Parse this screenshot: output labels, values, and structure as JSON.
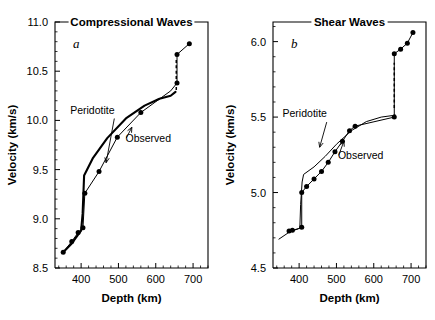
{
  "figure": {
    "background": "#ffffff",
    "ink_color": "#000000",
    "panels": [
      "a",
      "b"
    ]
  },
  "chart_data": [
    {
      "type": "line",
      "panel_letter": "a",
      "title": "Compressional Waves",
      "xlabel": "Depth (km)",
      "ylabel": "Velocity (km/s)",
      "xlim": [
        330,
        740
      ],
      "ylim": [
        8.5,
        11.0
      ],
      "xticks": [
        400,
        500,
        600,
        700
      ],
      "xtick_labels": [
        "400",
        "500",
        "600",
        "700"
      ],
      "x_minor_step": 20,
      "yticks": [
        8.5,
        9.0,
        9.5,
        10.0,
        10.5,
        11.0
      ],
      "ytick_labels": [
        "8.5",
        "9.0",
        "9.5",
        "10.0",
        "10.5",
        "11.0"
      ],
      "y_minor_step": 0.1,
      "grid": false,
      "legend": "inline-annotations",
      "series": [
        {
          "name": "Peridotite",
          "style": "thick-solid",
          "label_position": {
            "x": 430,
            "y": 10.07
          },
          "arrow_to": {
            "x": 467,
            "y": 9.57
          },
          "x": [
            352,
            375,
            392,
            400,
            404,
            408,
            432,
            470,
            520,
            570,
            610,
            640,
            653
          ],
          "y": [
            8.66,
            8.75,
            8.84,
            8.88,
            9.05,
            9.44,
            9.62,
            9.82,
            10.02,
            10.15,
            10.22,
            10.25,
            10.29
          ]
        },
        {
          "name": "Peridotite-discontinuity",
          "style": "dashed-vertical",
          "x": [
            655,
            655
          ],
          "y": [
            10.31,
            10.64
          ]
        },
        {
          "name": "Observed",
          "style": "thin-solid-with-markers",
          "label_position": {
            "x": 580,
            "y": 9.78
          },
          "arrow_to": {
            "x": 536,
            "y": 9.93
          },
          "x": [
            352,
            375,
            392,
            405,
            410,
            448,
            497,
            560,
            640,
            657,
            657,
            690
          ],
          "y": [
            8.66,
            8.77,
            8.86,
            8.91,
            9.26,
            9.48,
            9.83,
            10.08,
            10.3,
            10.38,
            10.67,
            10.78
          ],
          "marker_x": [
            352,
            375,
            392,
            405,
            410,
            448,
            497,
            560,
            657,
            657,
            690
          ],
          "marker_y": [
            8.66,
            8.77,
            8.86,
            8.91,
            9.26,
            9.48,
            9.83,
            10.08,
            10.38,
            10.67,
            10.78
          ]
        }
      ]
    },
    {
      "type": "line",
      "panel_letter": "b",
      "title": "Shear Waves",
      "xlabel": "Depth (km)",
      "ylabel": "Velocity (km/s)",
      "xlim": [
        330,
        740
      ],
      "ylim": [
        4.5,
        6.13
      ],
      "xticks": [
        400,
        500,
        600,
        700
      ],
      "xtick_labels": [
        "400",
        "500",
        "600",
        "700"
      ],
      "x_minor_step": 20,
      "yticks": [
        4.5,
        5.0,
        5.5,
        6.0
      ],
      "ytick_labels": [
        "4.5",
        "5.0",
        "5.5",
        "6.0"
      ],
      "y_minor_step": 0.1,
      "grid": false,
      "legend": "inline-annotations",
      "series": [
        {
          "name": "Peridotite",
          "style": "thin-solid",
          "label_position": {
            "x": 415,
            "y": 5.5
          },
          "arrow_to": {
            "x": 455,
            "y": 5.3
          },
          "x": [
            345,
            375,
            398,
            402,
            404,
            408,
            412,
            440,
            470,
            500,
            540,
            580,
            620,
            650,
            658
          ],
          "y": [
            4.69,
            4.74,
            4.76,
            4.77,
            4.92,
            5.07,
            5.12,
            5.17,
            5.24,
            5.32,
            5.41,
            5.47,
            5.5,
            5.51,
            5.515
          ]
        },
        {
          "name": "Peridotite-discontinuity",
          "style": "dashed-vertical",
          "x": [
            655,
            655
          ],
          "y": [
            5.56,
            5.86
          ]
        },
        {
          "name": "Observed",
          "style": "thin-solid-with-markers",
          "label_position": {
            "x": 565,
            "y": 5.22
          },
          "arrow_to": {
            "x": 520,
            "y": 5.34
          },
          "x": [
            373,
            382,
            405,
            407,
            407,
            420,
            440,
            460,
            478,
            496,
            516,
            535,
            550,
            655,
            655,
            672,
            690,
            705
          ],
          "y": [
            4.745,
            4.75,
            4.765,
            4.77,
            5.0,
            5.04,
            5.09,
            5.14,
            5.2,
            5.27,
            5.34,
            5.41,
            5.44,
            5.5,
            5.92,
            5.95,
            5.99,
            6.06
          ],
          "marker_x": [
            373,
            382,
            407,
            407,
            420,
            440,
            460,
            478,
            496,
            516,
            535,
            550,
            655,
            655,
            672,
            690,
            705
          ],
          "marker_y": [
            4.745,
            4.75,
            4.77,
            5.0,
            5.04,
            5.09,
            5.14,
            5.2,
            5.27,
            5.34,
            5.41,
            5.44,
            5.5,
            5.92,
            5.95,
            5.99,
            6.06
          ]
        }
      ]
    }
  ]
}
